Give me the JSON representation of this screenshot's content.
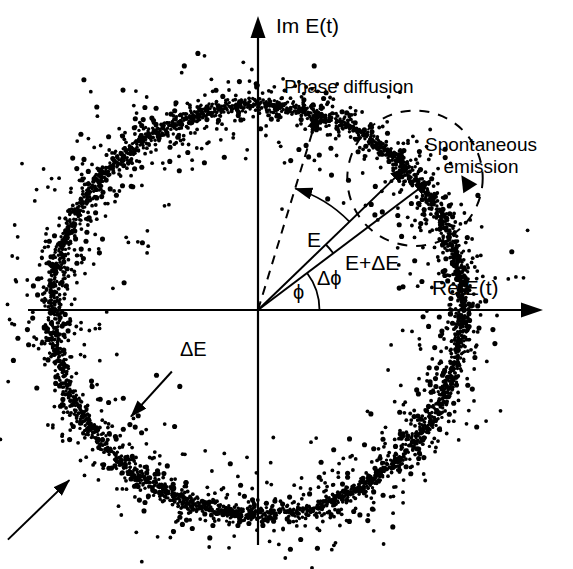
{
  "figure": {
    "kind": "phasor-diagram",
    "background_color": "#ffffff",
    "ink_color": "#000000",
    "axes": {
      "vertical_label": "Im E(t)",
      "horizontal_label": "Re E(t)",
      "origin": {
        "x": 258,
        "y": 310
      }
    },
    "annotations": {
      "phase_diffusion": "Phase diffusion",
      "spontaneous_emission_line1": "Spontaneous",
      "spontaneous_emission_line2": "emission",
      "field_vector": "E",
      "perturbed_field_vector": "E+ΔE",
      "phase_increment": "Δϕ",
      "phase_angle": "ϕ",
      "amplitude_fluctuation": "ΔE"
    }
  },
  "chart_data": {
    "type": "scatter",
    "title": "",
    "xlabel": "Re E(t)",
    "ylabel": "Im E(t)",
    "grid": false,
    "legend": "none",
    "xlim": [
      -1.45,
      1.45
    ],
    "ylim": [
      -1.45,
      1.45
    ],
    "xticks": [],
    "yticks": [],
    "ring": {
      "center": [
        0,
        0
      ],
      "mean_radius": 1.0,
      "radius_sigma": 0.055,
      "n_points": 1800,
      "dot_radius_px": 1.9
    },
    "vectors": [
      {
        "name": "E",
        "label": "E",
        "angle_deg": 44,
        "length": 1.0,
        "style": "solid",
        "arrow": true
      },
      {
        "name": "E+dE",
        "label": "E+ΔE",
        "angle_deg": 37,
        "length": 1.05,
        "style": "solid",
        "arrow": true
      },
      {
        "name": "E_prev",
        "label": "",
        "angle_deg": 73,
        "length": 1.0,
        "style": "dashed",
        "arrow": true
      }
    ],
    "angles": [
      {
        "name": "phi",
        "label": "ϕ",
        "from_deg": 0,
        "to_deg": 37,
        "radius": 0.3
      },
      {
        "name": "dphi",
        "label": "Δϕ",
        "from_deg": 37,
        "to_deg": 44,
        "radius": 0.46
      },
      {
        "name": "diffusion_arc",
        "label": "",
        "from_deg": 44,
        "to_deg": 73,
        "radius": 0.62,
        "arrow_at": "to"
      }
    ],
    "markers": [
      {
        "name": "spontaneous-emission-circle",
        "type": "dashed-circle",
        "center_angle_deg": 40,
        "center_radius": 1.0,
        "circle_radius": 0.33
      },
      {
        "name": "dE-callout-arrow",
        "type": "arrow",
        "from": [
          -0.42,
          -0.3
        ],
        "to": [
          -0.62,
          -0.52
        ]
      },
      {
        "name": "unlabeled-callout-arrow",
        "type": "arrow",
        "from": [
          -1.22,
          -1.12
        ],
        "to": [
          -0.92,
          -0.83
        ]
      }
    ]
  }
}
